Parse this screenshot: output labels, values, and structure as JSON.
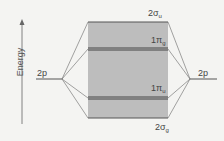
{
  "axis": {
    "label": "Energy"
  },
  "atomic_orbitals": {
    "left": {
      "label": "2p"
    },
    "right": {
      "label": "2p"
    }
  },
  "molecular_orbitals": [
    {
      "label": "2σ",
      "sub": "u",
      "y": 22
    },
    {
      "label": "1π",
      "sub": "g",
      "y": 49
    },
    {
      "label": "1π",
      "sub": "u",
      "y": 98
    },
    {
      "label": "2σ",
      "sub": "g",
      "y": 118
    }
  ],
  "colors": {
    "box": "#bdbdbd",
    "line": "#555555",
    "text": "#444444"
  }
}
